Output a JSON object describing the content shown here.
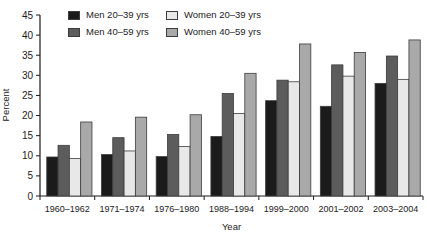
{
  "chart_data": {
    "type": "bar",
    "title": "",
    "xlabel": "Year",
    "ylabel": "Percent",
    "ylim": [
      0,
      45
    ],
    "ytick_step": 5,
    "grid": false,
    "legend_position": "top",
    "legend_display_order": [
      0,
      2,
      1,
      3
    ],
    "categories": [
      "1960–1962",
      "1971–1974",
      "1976–1980",
      "1988–1994",
      "1999–2000",
      "2001–2002",
      "2003–2004"
    ],
    "series": [
      {
        "name": "Men 20–39 yrs",
        "color": "#1b1b1b",
        "values": [
          9.7,
          10.3,
          9.8,
          14.8,
          23.7,
          22.3,
          28.0
        ]
      },
      {
        "name": "Men 40–59 yrs",
        "color": "#5c5c5c",
        "values": [
          12.6,
          14.5,
          15.3,
          25.5,
          28.8,
          32.6,
          34.8
        ]
      },
      {
        "name": "Women 20–39 yrs",
        "color": "#e8e8e8",
        "values": [
          9.3,
          11.2,
          12.3,
          20.5,
          28.4,
          29.8,
          29.0
        ]
      },
      {
        "name": "Women 40–59 yrs",
        "color": "#a9a9a9",
        "values": [
          18.4,
          19.6,
          20.2,
          30.5,
          37.8,
          35.7,
          38.8
        ]
      }
    ],
    "bar_outline": "#3c3c3c",
    "axis_color": "#1a1a1a",
    "text_color": "#1a1a1a",
    "background": "#ffffff"
  }
}
